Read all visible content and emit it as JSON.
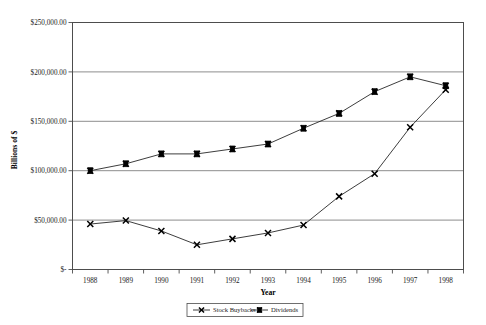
{
  "chart_data": {
    "type": "line",
    "title": "",
    "xlabel": "Year",
    "ylabel": "Billions of $",
    "categories": [
      "1988",
      "1989",
      "1990",
      "1991",
      "1992",
      "1993",
      "1994",
      "1995",
      "1996",
      "1997",
      "1998"
    ],
    "ylim": [
      0,
      250000
    ],
    "ytick_values": [
      0,
      50000,
      100000,
      150000,
      200000,
      250000
    ],
    "ytick_labels": [
      "$-",
      "$50,000.00",
      "$100,000.00",
      "$150,000.00",
      "$200,000.00",
      "$250,000.00"
    ],
    "grid": true,
    "legend_position": "bottom",
    "series": [
      {
        "name": "Stock Buybacks",
        "marker": "x",
        "values": [
          46000,
          49500,
          39000,
          25000,
          31000,
          37000,
          45000,
          74000,
          97000,
          144000,
          182000
        ]
      },
      {
        "name": "Dividends",
        "marker": "square",
        "values": [
          100000,
          107000,
          117000,
          117000,
          122000,
          127000,
          143000,
          158000,
          180000,
          195000,
          186000
        ]
      }
    ]
  },
  "legend": {
    "entries": [
      {
        "label": "Stock Buybacks"
      },
      {
        "label": "Dividends"
      }
    ]
  },
  "axes": {
    "y_title": "Billions of $",
    "x_title": "Year"
  }
}
